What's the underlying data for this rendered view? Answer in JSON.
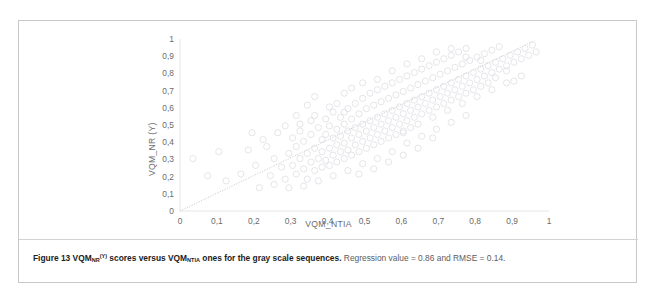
{
  "figure": {
    "caption_bold_1": "Figure 13 VQM",
    "caption_bold_sub_1": "NR",
    "caption_bold_sup_1": "(Y)",
    "caption_bold_2": " scores versus VQM",
    "caption_bold_sub_2": "NTIA",
    "caption_bold_3": " ones for the gray scale sequences.",
    "caption_rest": " Regression value = 0.86 and RMSE = 0.14.",
    "border_color": "#c9c9c9"
  },
  "chart_data": {
    "type": "scatter",
    "title": "",
    "xlabel": "VQM_NTIA",
    "ylabel": "VQM_NR (Y)",
    "xlim": [
      0,
      1
    ],
    "ylim": [
      0,
      1
    ],
    "grid": false,
    "marker": "open-circle",
    "marker_color": "#e2e2e6",
    "marker_size": 3.1,
    "xticks": [
      "0",
      "0,1",
      "0,2",
      "0,3",
      "0,4",
      "0,5",
      "0,6",
      "0,7",
      "0,8",
      "0,9",
      "1"
    ],
    "ytick_values": [
      0,
      0.1,
      0.2,
      0.3,
      0.4,
      0.5,
      0.6,
      0.7,
      0.8,
      0.9,
      1
    ],
    "yticks": [
      "0",
      "0,1",
      "0,2",
      "0,3",
      "0,4",
      "0,5",
      "0,6",
      "0,7",
      "0,8",
      "0,9",
      "1"
    ],
    "xtick_values": [
      0,
      0.1,
      0.2,
      0.3,
      0.4,
      0.5,
      0.6,
      0.7,
      0.8,
      0.9,
      1
    ],
    "annotations": {
      "regression_value": 0.86,
      "rmse": 0.14
    },
    "trendline": {
      "style": "dotted",
      "color": "#c6c6cc",
      "x0": 0.0,
      "y0": 0.0,
      "x1": 0.96,
      "y1": 0.99
    },
    "points": [
      [
        0.035,
        0.305
      ],
      [
        0.075,
        0.205
      ],
      [
        0.105,
        0.345
      ],
      [
        0.125,
        0.175
      ],
      [
        0.165,
        0.215
      ],
      [
        0.185,
        0.355
      ],
      [
        0.205,
        0.265
      ],
      [
        0.215,
        0.135
      ],
      [
        0.235,
        0.375
      ],
      [
        0.245,
        0.205
      ],
      [
        0.255,
        0.305
      ],
      [
        0.265,
        0.455
      ],
      [
        0.275,
        0.255
      ],
      [
        0.285,
        0.185
      ],
      [
        0.295,
        0.335
      ],
      [
        0.305,
        0.425
      ],
      [
        0.305,
        0.265
      ],
      [
        0.315,
        0.215
      ],
      [
        0.315,
        0.375
      ],
      [
        0.325,
        0.305
      ],
      [
        0.325,
        0.465
      ],
      [
        0.335,
        0.245
      ],
      [
        0.335,
        0.405
      ],
      [
        0.345,
        0.335
      ],
      [
        0.345,
        0.185
      ],
      [
        0.355,
        0.285
      ],
      [
        0.355,
        0.445
      ],
      [
        0.355,
        0.525
      ],
      [
        0.365,
        0.235
      ],
      [
        0.365,
        0.365
      ],
      [
        0.375,
        0.305
      ],
      [
        0.375,
        0.485
      ],
      [
        0.385,
        0.255
      ],
      [
        0.385,
        0.415
      ],
      [
        0.385,
        0.345
      ],
      [
        0.395,
        0.295
      ],
      [
        0.395,
        0.535
      ],
      [
        0.395,
        0.445
      ],
      [
        0.405,
        0.365
      ],
      [
        0.405,
        0.265
      ],
      [
        0.405,
        0.495
      ],
      [
        0.415,
        0.325
      ],
      [
        0.415,
        0.425
      ],
      [
        0.415,
        0.575
      ],
      [
        0.425,
        0.385
      ],
      [
        0.425,
        0.285
      ],
      [
        0.425,
        0.475
      ],
      [
        0.435,
        0.345
      ],
      [
        0.435,
        0.545
      ],
      [
        0.435,
        0.435
      ],
      [
        0.445,
        0.305
      ],
      [
        0.445,
        0.505
      ],
      [
        0.445,
        0.395
      ],
      [
        0.455,
        0.465
      ],
      [
        0.455,
        0.355
      ],
      [
        0.455,
        0.595
      ],
      [
        0.465,
        0.425
      ],
      [
        0.465,
        0.325
      ],
      [
        0.465,
        0.535
      ],
      [
        0.475,
        0.485
      ],
      [
        0.475,
        0.385
      ],
      [
        0.475,
        0.625
      ],
      [
        0.485,
        0.445
      ],
      [
        0.485,
        0.565
      ],
      [
        0.485,
        0.345
      ],
      [
        0.495,
        0.505
      ],
      [
        0.495,
        0.405
      ],
      [
        0.495,
        0.655
      ],
      [
        0.505,
        0.465
      ],
      [
        0.505,
        0.595
      ],
      [
        0.505,
        0.365
      ],
      [
        0.515,
        0.525
      ],
      [
        0.515,
        0.425
      ],
      [
        0.515,
        0.685
      ],
      [
        0.525,
        0.485
      ],
      [
        0.525,
        0.615
      ],
      [
        0.525,
        0.385
      ],
      [
        0.535,
        0.545
      ],
      [
        0.535,
        0.445
      ],
      [
        0.535,
        0.705
      ],
      [
        0.545,
        0.505
      ],
      [
        0.545,
        0.635
      ],
      [
        0.545,
        0.405
      ],
      [
        0.555,
        0.565
      ],
      [
        0.555,
        0.465
      ],
      [
        0.555,
        0.725
      ],
      [
        0.565,
        0.525
      ],
      [
        0.565,
        0.655
      ],
      [
        0.565,
        0.425
      ],
      [
        0.575,
        0.585
      ],
      [
        0.575,
        0.485
      ],
      [
        0.575,
        0.745
      ],
      [
        0.585,
        0.545
      ],
      [
        0.585,
        0.675
      ],
      [
        0.585,
        0.445
      ],
      [
        0.595,
        0.605
      ],
      [
        0.595,
        0.505
      ],
      [
        0.595,
        0.765
      ],
      [
        0.605,
        0.565
      ],
      [
        0.605,
        0.695
      ],
      [
        0.605,
        0.465
      ],
      [
        0.615,
        0.625
      ],
      [
        0.615,
        0.525
      ],
      [
        0.615,
        0.785
      ],
      [
        0.625,
        0.585
      ],
      [
        0.625,
        0.715
      ],
      [
        0.625,
        0.485
      ],
      [
        0.635,
        0.645
      ],
      [
        0.635,
        0.545
      ],
      [
        0.635,
        0.805
      ],
      [
        0.645,
        0.605
      ],
      [
        0.645,
        0.735
      ],
      [
        0.655,
        0.665
      ],
      [
        0.655,
        0.565
      ],
      [
        0.655,
        0.825
      ],
      [
        0.665,
        0.625
      ],
      [
        0.665,
        0.755
      ],
      [
        0.675,
        0.685
      ],
      [
        0.675,
        0.585
      ],
      [
        0.675,
        0.845
      ],
      [
        0.685,
        0.645
      ],
      [
        0.685,
        0.775
      ],
      [
        0.695,
        0.705
      ],
      [
        0.695,
        0.605
      ],
      [
        0.695,
        0.865
      ],
      [
        0.705,
        0.665
      ],
      [
        0.705,
        0.795
      ],
      [
        0.715,
        0.725
      ],
      [
        0.715,
        0.625
      ],
      [
        0.715,
        0.885
      ],
      [
        0.725,
        0.685
      ],
      [
        0.725,
        0.815
      ],
      [
        0.735,
        0.745
      ],
      [
        0.735,
        0.645
      ],
      [
        0.735,
        0.905
      ],
      [
        0.745,
        0.705
      ],
      [
        0.745,
        0.835
      ],
      [
        0.755,
        0.765
      ],
      [
        0.755,
        0.665
      ],
      [
        0.755,
        0.925
      ],
      [
        0.765,
        0.725
      ],
      [
        0.765,
        0.855
      ],
      [
        0.775,
        0.785
      ],
      [
        0.775,
        0.685
      ],
      [
        0.775,
        0.945
      ],
      [
        0.785,
        0.745
      ],
      [
        0.785,
        0.875
      ],
      [
        0.795,
        0.805
      ],
      [
        0.795,
        0.705
      ],
      [
        0.805,
        0.765
      ],
      [
        0.805,
        0.895
      ],
      [
        0.815,
        0.825
      ],
      [
        0.815,
        0.725
      ],
      [
        0.825,
        0.785
      ],
      [
        0.825,
        0.915
      ],
      [
        0.835,
        0.845
      ],
      [
        0.835,
        0.745
      ],
      [
        0.845,
        0.805
      ],
      [
        0.845,
        0.935
      ],
      [
        0.855,
        0.865
      ],
      [
        0.865,
        0.825
      ],
      [
        0.865,
        0.955
      ],
      [
        0.875,
        0.885
      ],
      [
        0.885,
        0.845
      ],
      [
        0.895,
        0.905
      ],
      [
        0.905,
        0.865
      ],
      [
        0.915,
        0.925
      ],
      [
        0.925,
        0.885
      ],
      [
        0.935,
        0.945
      ],
      [
        0.945,
        0.905
      ],
      [
        0.955,
        0.965
      ],
      [
        0.965,
        0.925
      ],
      [
        0.195,
        0.455
      ],
      [
        0.225,
        0.415
      ],
      [
        0.285,
        0.495
      ],
      [
        0.315,
        0.555
      ],
      [
        0.345,
        0.615
      ],
      [
        0.365,
        0.665
      ],
      [
        0.425,
        0.625
      ],
      [
        0.445,
        0.685
      ],
      [
        0.465,
        0.715
      ],
      [
        0.495,
        0.745
      ],
      [
        0.535,
        0.765
      ],
      [
        0.575,
        0.815
      ],
      [
        0.615,
        0.855
      ],
      [
        0.655,
        0.885
      ],
      [
        0.695,
        0.925
      ],
      [
        0.735,
        0.945
      ],
      [
        0.775,
        0.895
      ],
      [
        0.815,
        0.875
      ],
      [
        0.855,
        0.775
      ],
      [
        0.885,
        0.815
      ],
      [
        0.905,
        0.755
      ],
      [
        0.255,
        0.155
      ],
      [
        0.295,
        0.135
      ],
      [
        0.335,
        0.145
      ],
      [
        0.375,
        0.175
      ],
      [
        0.415,
        0.205
      ],
      [
        0.455,
        0.235
      ],
      [
        0.495,
        0.275
      ],
      [
        0.535,
        0.305
      ],
      [
        0.575,
        0.345
      ],
      [
        0.615,
        0.395
      ],
      [
        0.655,
        0.435
      ],
      [
        0.695,
        0.475
      ],
      [
        0.735,
        0.515
      ],
      [
        0.775,
        0.555
      ],
      [
        0.485,
        0.215
      ],
      [
        0.525,
        0.245
      ],
      [
        0.565,
        0.285
      ],
      [
        0.605,
        0.325
      ],
      [
        0.645,
        0.365
      ],
      [
        0.685,
        0.545
      ],
      [
        0.725,
        0.585
      ],
      [
        0.765,
        0.625
      ],
      [
        0.805,
        0.665
      ],
      [
        0.845,
        0.705
      ],
      [
        0.885,
        0.745
      ],
      [
        0.925,
        0.785
      ],
      [
        0.605,
        0.455
      ],
      [
        0.645,
        0.505
      ],
      [
        0.685,
        0.425
      ],
      [
        0.445,
        0.575
      ],
      [
        0.405,
        0.605
      ],
      [
        0.365,
        0.555
      ],
      [
        0.325,
        0.505
      ]
    ]
  }
}
